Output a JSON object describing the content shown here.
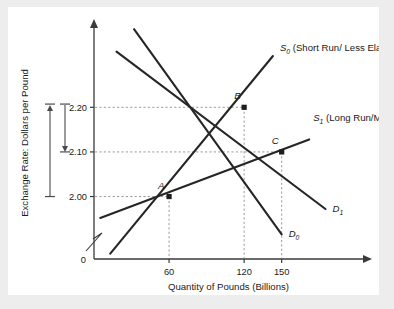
{
  "figure": {
    "background_color": "#ededee",
    "panel_color": "#ffffff",
    "origin_label": "0"
  },
  "chart_data": {
    "type": "line",
    "title": "",
    "xlabel": "Quantity of Pounds (Billions)",
    "ylabel": "Exchange Rate: Dollars per Pound",
    "xlim": [
      0,
      215
    ],
    "ylim": [
      1.86,
      2.38
    ],
    "grid": false,
    "guides": "dashed",
    "legend_position": "inline-right",
    "xticks": [
      60,
      120,
      150
    ],
    "xticklabels": [
      "60",
      "120",
      "150"
    ],
    "yticks": [
      2.0,
      2.1,
      2.2
    ],
    "yticklabels": [
      "2.00",
      "2.10",
      "2.20"
    ],
    "axis_break": true,
    "series": [
      {
        "name": "D0",
        "label": "D",
        "sublabel": "0",
        "role": "demand-initial",
        "x": [
          32,
          150
        ],
        "y": [
          2.375,
          1.915
        ],
        "color": "#262626"
      },
      {
        "name": "D1",
        "label": "D",
        "sublabel": "1",
        "role": "demand-shifted",
        "x": [
          18,
          185
        ],
        "y": [
          2.325,
          1.972
        ],
        "color": "#262626"
      },
      {
        "name": "S0",
        "label": "S",
        "sublabel": "0",
        "annotation": "(Short Run/ Less Elastic)",
        "role": "supply-short-run",
        "x": [
          13,
          143
        ],
        "y": [
          1.872,
          2.315
        ],
        "color": "#262626"
      },
      {
        "name": "S1",
        "label": "S",
        "sublabel": "1",
        "annotation": "(Long Run/More Elastic)",
        "role": "supply-long-run",
        "x": [
          5,
          172
        ],
        "y": [
          1.952,
          2.128
        ],
        "color": "#262626"
      }
    ],
    "points": [
      {
        "name": "A",
        "x": 60,
        "y": 2.0,
        "label": "A"
      },
      {
        "name": "B",
        "x": 120,
        "y": 2.2,
        "label": "B"
      },
      {
        "name": "C",
        "x": 150,
        "y": 2.1,
        "label": "C"
      }
    ],
    "annotations": [
      {
        "name": "rise-arrow",
        "from_y": 2.0,
        "to_y": 2.205,
        "direction": "up",
        "description": "short-run appreciation"
      },
      {
        "name": "fall-arrow",
        "from_y": 2.205,
        "to_y": 2.1,
        "direction": "down",
        "description": "long-run partial reversal"
      }
    ]
  }
}
